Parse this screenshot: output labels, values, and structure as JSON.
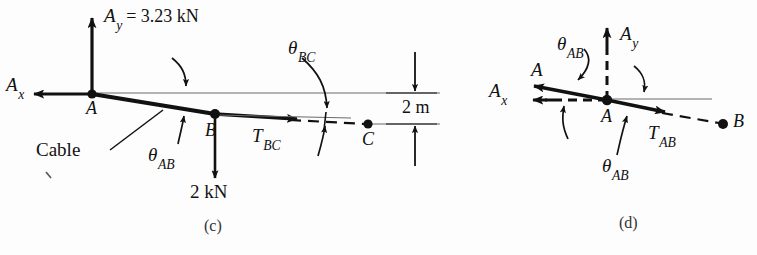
{
  "figure": {
    "background_color": "#fdfdfd",
    "ink_color": "#111111",
    "thin_line_color": "#4a4a4a",
    "panels": [
      {
        "id": "c",
        "caption": "(c)",
        "description": "Free-body diagram of cable segment A-B-C with reactions at A and 2 kN load at B"
      },
      {
        "id": "d",
        "caption": "(d)",
        "description": "Free-body diagram of joint A showing A, Ax, Ay, TAB and angles"
      }
    ]
  },
  "panel_c": {
    "caption": "(c)",
    "reaction_y": {
      "symbol": "A",
      "sub": "y",
      "equals": "= 3.23 kN",
      "value": 3.23,
      "unit": "kN"
    },
    "reaction_x": {
      "symbol": "A",
      "sub": "x"
    },
    "point_a": "A",
    "point_b": "B",
    "point_c": "C",
    "cable_label": "Cable",
    "theta_ab": {
      "symbol": "θ",
      "sub": "AB"
    },
    "theta_bc": {
      "symbol": "θ",
      "sub": "BC"
    },
    "tension_bc": {
      "symbol": "T",
      "sub": "BC"
    },
    "load_b": {
      "text": "2 kN",
      "value": 2,
      "unit": "kN"
    },
    "dimension": {
      "text": "2 m",
      "value": 2,
      "unit": "m"
    }
  },
  "panel_d": {
    "caption": "(d)",
    "resultant": {
      "symbol": "A"
    },
    "reaction_y": {
      "symbol": "A",
      "sub": "y"
    },
    "reaction_x": {
      "symbol": "A",
      "sub": "x"
    },
    "point_a": "A",
    "point_b": "B",
    "theta_ab_upper": {
      "symbol": "θ",
      "sub": "AB"
    },
    "theta_ab_lower": {
      "symbol": "θ",
      "sub": "AB"
    },
    "tension_ab": {
      "symbol": "T",
      "sub": "AB"
    }
  }
}
